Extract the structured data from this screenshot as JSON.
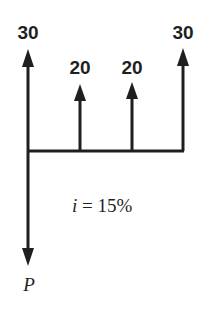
{
  "diagram": {
    "type": "cash-flow-diagram",
    "interest_rate_label": "i = 15%",
    "interest_var": "i",
    "interest_eq": " = 15%",
    "present_value_label": "P",
    "cash_flows": [
      {
        "period": 0,
        "amount": "30",
        "direction": "up"
      },
      {
        "period": 1,
        "amount": "20",
        "direction": "up"
      },
      {
        "period": 2,
        "amount": "20",
        "direction": "up"
      },
      {
        "period": 3,
        "amount": "30",
        "direction": "up"
      }
    ],
    "colors": {
      "ink": "#1f1f1f",
      "background": "#ffffff"
    }
  }
}
